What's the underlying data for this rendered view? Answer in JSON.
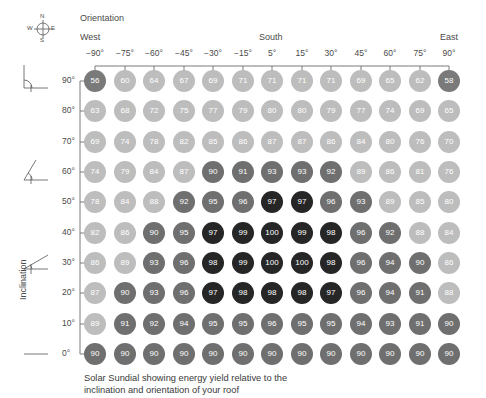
{
  "header": {
    "orientation_label": "Orientation",
    "west": "West",
    "south": "South",
    "east": "East",
    "compass": {
      "n": "N",
      "e": "E",
      "s": "S",
      "w": "W"
    }
  },
  "axis": {
    "inclination_label": "Inclination"
  },
  "caption": {
    "line1": "Solar Sundial showing energy yield relative to the",
    "line2": "inclination and orientation of your roof"
  },
  "colors": {
    "light": "#bdbdbd",
    "medium": "#6f6f6f",
    "dark": "#262626",
    "corner": "#7a7a7a",
    "line": "#7a7a7a"
  },
  "chart_data": {
    "type": "heatmap",
    "title": "Solar Sundial showing energy yield relative to the inclination and orientation of your roof",
    "xlabel": "Orientation",
    "ylabel": "Inclination",
    "x_direction_labels": {
      "left": "West",
      "center": "South",
      "right": "East"
    },
    "columns": [
      "−90°",
      "−75°",
      "−60°",
      "−45°",
      "−30°",
      "−15°",
      "5°",
      "15°",
      "30°",
      "45°",
      "60°",
      "75°",
      "90°"
    ],
    "rows": [
      "90°",
      "80°",
      "70°",
      "60°",
      "50°",
      "40°",
      "30°",
      "20°",
      "10°",
      "0°"
    ],
    "values": [
      [
        56,
        60,
        64,
        67,
        69,
        71,
        71,
        71,
        71,
        69,
        65,
        62,
        58
      ],
      [
        63,
        68,
        72,
        75,
        77,
        79,
        80,
        80,
        79,
        77,
        74,
        69,
        65
      ],
      [
        69,
        74,
        78,
        82,
        85,
        86,
        87,
        87,
        86,
        84,
        80,
        76,
        70
      ],
      [
        74,
        79,
        84,
        87,
        90,
        91,
        93,
        93,
        92,
        89,
        86,
        81,
        76
      ],
      [
        78,
        84,
        88,
        92,
        95,
        96,
        97,
        97,
        96,
        93,
        89,
        85,
        80
      ],
      [
        82,
        86,
        90,
        95,
        97,
        99,
        100,
        99,
        98,
        96,
        92,
        88,
        84
      ],
      [
        86,
        89,
        93,
        96,
        98,
        99,
        100,
        100,
        98,
        96,
        94,
        90,
        86
      ],
      [
        87,
        90,
        93,
        96,
        97,
        98,
        98,
        98,
        97,
        96,
        94,
        91,
        88
      ],
      [
        89,
        91,
        92,
        94,
        95,
        95,
        96,
        95,
        95,
        94,
        93,
        91,
        90
      ],
      [
        90,
        90,
        90,
        90,
        90,
        90,
        90,
        90,
        90,
        90,
        90,
        90,
        90
      ]
    ],
    "color_scale": {
      "below_90": "light gray",
      "90_to_96": "dark gray",
      "97_to_100": "near black",
      "below_60": "medium gray"
    },
    "legend": "none",
    "grid": false
  }
}
